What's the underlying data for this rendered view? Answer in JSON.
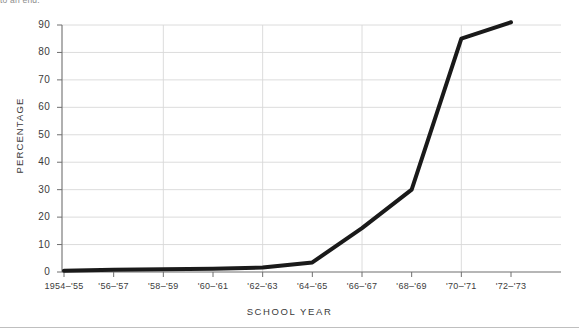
{
  "page": {
    "clipped_text": "to an end.",
    "background_color": "#ffffff"
  },
  "chart_data": {
    "type": "line",
    "title": "",
    "xlabel": "SCHOOL  YEAR",
    "ylabel": "PERCENTAGE",
    "categories": [
      "1954–'55",
      "'56–'57",
      "'58–'59",
      "'60–'61",
      "'62–'63",
      "'64–'65",
      "'66–'67",
      "'68–'69",
      "'70–'71",
      "'72–'73"
    ],
    "values": [
      0.5,
      0.8,
      1.0,
      1.2,
      1.6,
      3.5,
      16,
      30,
      85,
      91
    ],
    "series": [
      {
        "name": "Percentage",
        "values": [
          0.5,
          0.8,
          1.0,
          1.2,
          1.6,
          3.5,
          16,
          30,
          85,
          91
        ],
        "color": "#1a1a1a"
      }
    ],
    "ylim": [
      0,
      90
    ],
    "xlim": [
      0,
      9
    ],
    "yticks": [
      0,
      10,
      20,
      30,
      40,
      50,
      60,
      70,
      80,
      90
    ],
    "ytick_labels": [
      "0",
      "10",
      "20",
      "30",
      "40",
      "50",
      "60",
      "70",
      "80",
      "90"
    ],
    "grid": true,
    "grid_color": "#d8d8d8",
    "axis_color": "#7a7a7a",
    "line_width": 4,
    "legend": "none"
  }
}
